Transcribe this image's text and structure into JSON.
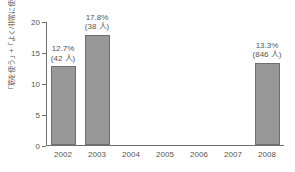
{
  "chart_data": {
    "type": "bar",
    "title": "",
    "subtitle": "",
    "xlabel": "",
    "ylabel": "「筋を使う」+「よく/非常に使う」の割合(%)",
    "categories": [
      "2002",
      "2003",
      "2004",
      "2005",
      "2006",
      "2007",
      "2008"
    ],
    "values": [
      12.7,
      17.8,
      null,
      null,
      null,
      null,
      13.3
    ],
    "ylim": [
      0,
      20
    ],
    "yticks": [
      0,
      5,
      10,
      15,
      20
    ],
    "ytick_labels": [
      "0",
      "5",
      "10",
      "15",
      "20"
    ],
    "grid": false,
    "legend": false,
    "bar_color": "#989898",
    "bar_edge_color": "#6f6f6f",
    "axis_color": "#6e6e6e",
    "text_color": "#555555",
    "point_labels": [
      {
        "category": "2002",
        "percent": "12.7%",
        "count": "(42 人)"
      },
      {
        "category": "2003",
        "percent": "17.8%",
        "count": "(38 人)"
      },
      {
        "category": "2004",
        "percent": "",
        "count": ""
      },
      {
        "category": "2005",
        "percent": "",
        "count": ""
      },
      {
        "category": "2006",
        "percent": "",
        "count": ""
      },
      {
        "category": "2007",
        "percent": "",
        "count": ""
      },
      {
        "category": "2008",
        "percent": "13.3%",
        "count": "(846 人)"
      }
    ]
  }
}
